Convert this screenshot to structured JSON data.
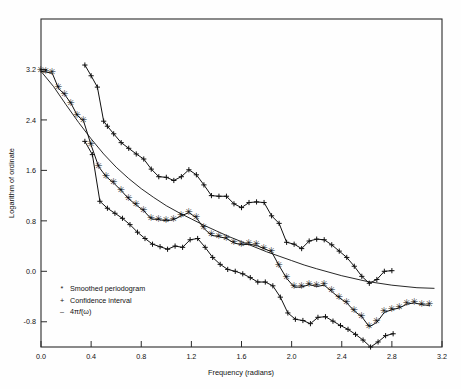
{
  "figure": {
    "background": "#fefefe",
    "frame_color": "#2b2b2b",
    "ink_color": "#101010"
  },
  "axes": {
    "x_title": "Frequency  (radians)",
    "y_title": "Logarithm of ordinate",
    "x_ticks": [
      "0.0",
      "0.4",
      "0.8",
      "1.2",
      "1.6",
      "2.0",
      "2.4",
      "2.8",
      "3.2"
    ],
    "y_ticks": [
      "3.2",
      "2.4",
      "1.6",
      "0.8",
      "0.0",
      "-0.8"
    ]
  },
  "legend": {
    "items": [
      {
        "marker": "*",
        "label": "Smoothed periodogram"
      },
      {
        "marker": "+",
        "label": "Confidence interval"
      },
      {
        "marker": "–",
        "label_prefix": "4π",
        "label_italic": "f",
        "label_suffix": "(ω)"
      }
    ]
  },
  "chart_data": {
    "type": "line",
    "title": "",
    "xlabel": "Frequency  (radians)",
    "ylabel": "Logarithm of ordinate",
    "xlim": [
      0.0,
      3.2
    ],
    "ylim": [
      -1.2,
      4.0
    ],
    "grid": false,
    "legend_position": "lower-left",
    "series": [
      {
        "name": "Confidence interval (upper)",
        "marker": "+",
        "x": [
          0.35,
          0.4,
          0.45,
          0.5,
          0.53,
          0.58,
          0.64,
          0.7,
          0.76,
          0.82,
          0.88,
          0.94,
          1.0,
          1.06,
          1.12,
          1.18,
          1.24,
          1.3,
          1.36,
          1.42,
          1.48,
          1.54,
          1.6,
          1.66,
          1.72,
          1.78,
          1.84,
          1.9,
          1.96,
          2.02,
          2.08,
          2.14,
          2.2,
          2.26,
          2.32,
          2.38,
          2.44,
          2.5,
          2.56,
          2.62,
          2.68,
          2.74,
          2.8
        ],
        "y": [
          3.27,
          3.1,
          2.92,
          2.38,
          2.3,
          2.18,
          2.04,
          1.95,
          1.86,
          1.78,
          1.62,
          1.5,
          1.49,
          1.44,
          1.5,
          1.61,
          1.53,
          1.37,
          1.2,
          1.19,
          1.19,
          1.07,
          1.01,
          1.09,
          1.1,
          1.09,
          0.88,
          0.76,
          0.46,
          0.43,
          0.36,
          0.48,
          0.51,
          0.5,
          0.42,
          0.32,
          0.22,
          0.08,
          -0.08,
          -0.19,
          -0.13,
          0.0,
          0.01
        ]
      },
      {
        "name": "Smoothed periodogram",
        "marker": "*",
        "x": [
          0.0,
          0.04,
          0.09,
          0.14,
          0.19,
          0.24,
          0.29,
          0.34,
          0.4,
          0.46,
          0.52,
          0.58,
          0.64,
          0.7,
          0.76,
          0.82,
          0.88,
          0.94,
          1.0,
          1.06,
          1.12,
          1.18,
          1.24,
          1.3,
          1.36,
          1.42,
          1.48,
          1.54,
          1.6,
          1.66,
          1.72,
          1.78,
          1.84,
          1.9,
          1.96,
          2.02,
          2.08,
          2.14,
          2.2,
          2.26,
          2.32,
          2.38,
          2.44,
          2.5,
          2.56,
          2.62,
          2.68,
          2.74,
          2.8,
          2.86,
          2.92,
          2.98,
          3.04,
          3.1
        ],
        "y": [
          3.17,
          3.16,
          3.14,
          2.9,
          2.8,
          2.66,
          2.47,
          2.38,
          2.0,
          1.66,
          1.5,
          1.4,
          1.28,
          1.15,
          1.05,
          0.96,
          0.83,
          0.82,
          0.8,
          0.82,
          0.88,
          0.93,
          0.85,
          0.68,
          0.57,
          0.55,
          0.52,
          0.45,
          0.42,
          0.43,
          0.41,
          0.36,
          0.31,
          0.09,
          -0.11,
          -0.25,
          -0.25,
          -0.21,
          -0.24,
          -0.22,
          -0.32,
          -0.42,
          -0.5,
          -0.63,
          -0.72,
          -0.88,
          -0.81,
          -0.65,
          -0.61,
          -0.58,
          -0.52,
          -0.5,
          -0.53,
          -0.54
        ]
      },
      {
        "name": "Confidence interval (lower)",
        "marker": "+",
        "x": [
          0.35,
          0.41,
          0.47,
          0.53,
          0.59,
          0.65,
          0.71,
          0.77,
          0.83,
          0.89,
          0.95,
          1.01,
          1.07,
          1.13,
          1.19,
          1.25,
          1.31,
          1.37,
          1.43,
          1.49,
          1.55,
          1.61,
          1.67,
          1.73,
          1.79,
          1.85,
          1.91,
          1.97,
          2.03,
          2.09,
          2.15,
          2.21,
          2.27,
          2.33,
          2.39,
          2.45,
          2.51,
          2.57,
          2.63,
          2.69,
          2.75,
          2.81
        ],
        "y": [
          2.06,
          1.85,
          1.11,
          1.0,
          0.92,
          0.84,
          0.74,
          0.62,
          0.52,
          0.43,
          0.39,
          0.35,
          0.4,
          0.38,
          0.5,
          0.52,
          0.38,
          0.22,
          0.11,
          0.03,
          0.0,
          -0.04,
          -0.1,
          -0.17,
          -0.17,
          -0.23,
          -0.41,
          -0.66,
          -0.76,
          -0.78,
          -0.83,
          -0.73,
          -0.72,
          -0.79,
          -0.86,
          -0.92,
          -1.0,
          -1.09,
          -1.2,
          -1.12,
          -1.02,
          -0.99
        ]
      }
    ],
    "theory_curve": {
      "name": "4πf(ω)",
      "marker": "line",
      "x": [
        0.0,
        0.1,
        0.2,
        0.3,
        0.4,
        0.5,
        0.6,
        0.7,
        0.8,
        0.9,
        1.0,
        1.1,
        1.2,
        1.3,
        1.4,
        1.5,
        1.6,
        1.7,
        1.8,
        1.9,
        2.0,
        2.1,
        2.2,
        2.4,
        2.6,
        2.8,
        3.0,
        3.14
      ],
      "y": [
        3.17,
        2.93,
        2.64,
        2.36,
        2.1,
        1.86,
        1.65,
        1.47,
        1.31,
        1.17,
        1.04,
        0.93,
        0.83,
        0.73,
        0.64,
        0.55,
        0.47,
        0.39,
        0.31,
        0.24,
        0.17,
        0.1,
        0.04,
        -0.07,
        -0.16,
        -0.22,
        -0.26,
        -0.27
      ]
    }
  }
}
